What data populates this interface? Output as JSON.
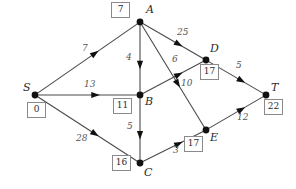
{
  "diagram": {
    "type": "directed-weighted-graph",
    "title": "",
    "nodes": [
      {
        "id": "S",
        "label": "S",
        "distance": "0",
        "x": 35,
        "y": 95,
        "label_dx": -12,
        "label_dy": -13,
        "box_dx": -8,
        "box_dy": 7
      },
      {
        "id": "A",
        "label": "A",
        "distance": "7",
        "x": 140,
        "y": 22,
        "label_dx": 6,
        "label_dy": -18,
        "box_dx": -29,
        "box_dy": -20
      },
      {
        "id": "B",
        "label": "B",
        "distance": "11",
        "x": 140,
        "y": 95,
        "label_dx": 5,
        "label_dy": 1,
        "box_dx": -27,
        "box_dy": 3
      },
      {
        "id": "C",
        "label": "C",
        "distance": "16",
        "x": 140,
        "y": 163,
        "label_dx": 4,
        "label_dy": 4,
        "box_dx": -28,
        "box_dy": -8
      },
      {
        "id": "D",
        "label": "D",
        "distance": "17",
        "x": 206,
        "y": 60,
        "label_dx": 4,
        "label_dy": -17,
        "box_dx": -6,
        "box_dy": 4
      },
      {
        "id": "E",
        "label": "E",
        "distance": "17",
        "x": 206,
        "y": 130,
        "label_dx": 4,
        "label_dy": 2,
        "box_dx": -22,
        "box_dy": 6
      },
      {
        "id": "T",
        "label": "T",
        "distance": "22",
        "x": 266,
        "y": 95,
        "label_dx": 5,
        "label_dy": -13,
        "box_dx": -2,
        "box_dy": 4
      }
    ],
    "edges": [
      {
        "id": "S-A",
        "from": "S",
        "to": "A",
        "weight": "7",
        "wx": 82,
        "wy": 44
      },
      {
        "id": "S-B",
        "from": "S",
        "to": "B",
        "weight": "13",
        "wx": 84,
        "wy": 80
      },
      {
        "id": "S-C",
        "from": "S",
        "to": "C",
        "weight": "28",
        "wx": 76,
        "wy": 134
      },
      {
        "id": "A-B",
        "from": "A",
        "to": "B",
        "weight": "4",
        "wx": 126,
        "wy": 53
      },
      {
        "id": "A-D",
        "from": "A",
        "to": "D",
        "weight": "25",
        "wx": 177,
        "wy": 28
      },
      {
        "id": "A-E",
        "from": "A",
        "to": "E",
        "weight": "10",
        "wx": 181,
        "wy": 79
      },
      {
        "id": "B-C",
        "from": "B",
        "to": "C",
        "weight": "5",
        "wx": 127,
        "wy": 122
      },
      {
        "id": "B-D",
        "from": "B",
        "to": "D",
        "weight": "6",
        "wx": 172,
        "wy": 55
      },
      {
        "id": "C-E",
        "from": "C",
        "to": "E",
        "weight": "3",
        "wx": 173,
        "wy": 146
      },
      {
        "id": "D-T",
        "from": "D",
        "to": "T",
        "weight": "5",
        "wx": 236,
        "wy": 61
      },
      {
        "id": "E-T",
        "from": "E",
        "to": "T",
        "weight": "12",
        "wx": 237,
        "wy": 113
      }
    ],
    "colors": {
      "edge": "#4a4a4a",
      "node": "#111111",
      "box_border": "#8a8a8a",
      "text": "#2b2b2b",
      "background": "#ffffff"
    }
  }
}
